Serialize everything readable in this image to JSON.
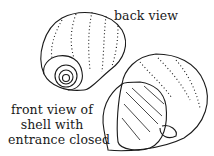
{
  "figure": {
    "type": "illustration",
    "labels": {
      "back": "back view",
      "front_lines": [
        "front view of",
        "shell with",
        "entrance closed"
      ]
    }
  }
}
